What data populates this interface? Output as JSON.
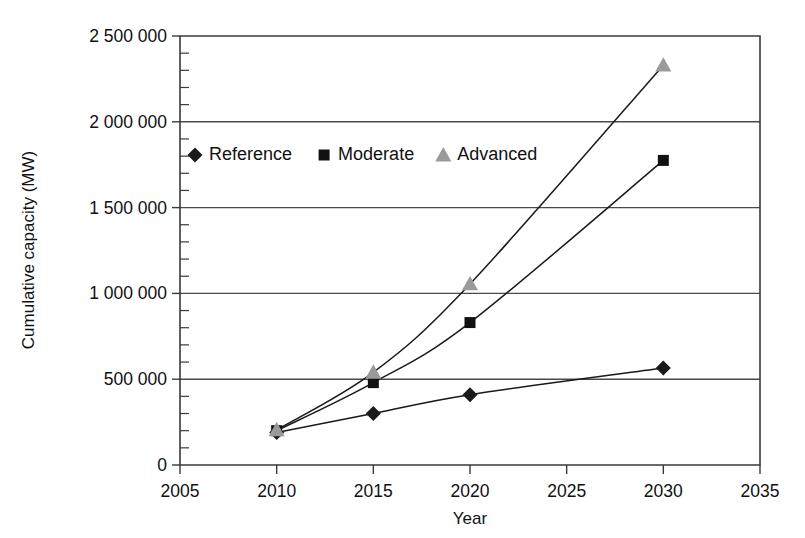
{
  "chart_data": {
    "type": "line",
    "title": "",
    "subtitle": "",
    "xlabel": "Year",
    "ylabel": "Cumulative capacity (MW)",
    "xlim": [
      2005,
      2035
    ],
    "ylim": [
      0,
      2500000
    ],
    "x": [
      2010,
      2015,
      2020,
      2030
    ],
    "grid": "horizontal",
    "legend_position": "upper-left-inside",
    "xticks": [
      2005,
      2010,
      2015,
      2020,
      2025,
      2030,
      2035
    ],
    "xticklabels": [
      "2005",
      "2010",
      "2015",
      "2020",
      "2025",
      "2030",
      "2035"
    ],
    "yticks": [
      0,
      500000,
      1000000,
      1500000,
      2000000,
      2500000
    ],
    "yticklabels": [
      "0",
      "500 000",
      "1 000 000",
      "1 500 000",
      "2 000 000",
      "2 500 000"
    ],
    "yminortick_step": 100000,
    "series": [
      {
        "name": "Reference",
        "marker": "diamond",
        "color": "#1a1a1a",
        "values": [
          190000,
          300000,
          410000,
          565000
        ]
      },
      {
        "name": "Moderate",
        "marker": "square",
        "color": "#111111",
        "values": [
          200000,
          480000,
          830000,
          1775000
        ]
      },
      {
        "name": "Advanced",
        "marker": "triangle",
        "color": "#9a9a9a",
        "values": [
          205000,
          540000,
          1055000,
          2330000
        ]
      }
    ]
  },
  "legend": {
    "items": [
      {
        "label": "Reference",
        "marker": "diamond-marker"
      },
      {
        "label": "Moderate",
        "marker": "square-marker"
      },
      {
        "label": "Advanced",
        "marker": "triangle-marker"
      }
    ]
  },
  "axes": {
    "x_title": "Year",
    "y_title": "Cumulative capacity (MW)"
  }
}
